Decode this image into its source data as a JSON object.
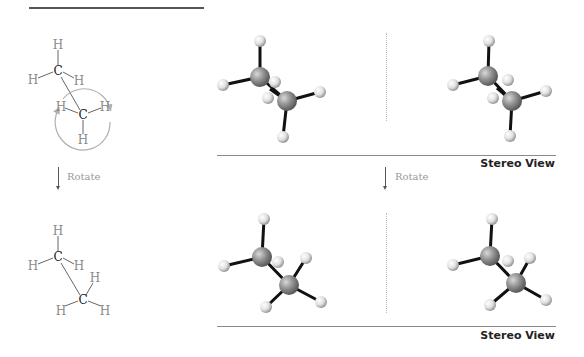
{
  "figure": {
    "top_section": {
      "rotate_label": "Rotate",
      "stereo_label": "Stereo View"
    },
    "bottom_section": {
      "stereo_label": "Stereo View"
    },
    "left_rotate_label": "Rotate",
    "formula_labels": {
      "hydrogen": "H",
      "carbon": "C"
    },
    "colors": {
      "carbon_atom": "#8e8e8e",
      "hydrogen_atom": "#e6e6e6",
      "bond": "#111111",
      "formula_carbon": "#222222",
      "formula_hydrogen": "#8a8a8a",
      "rotation_arc": "#b0b0b0"
    }
  }
}
